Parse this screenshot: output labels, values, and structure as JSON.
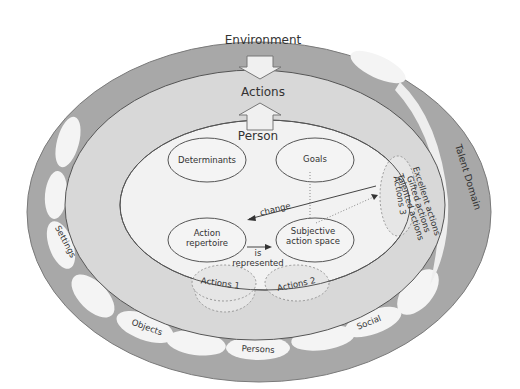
{
  "diagram": {
    "outer_ring": {
      "label": "Environment",
      "color": "#a6a6a6"
    },
    "middle_ring": {
      "label": "Actions",
      "color": "#d6d6d6"
    },
    "inner": {
      "label": "Person",
      "color": "#f0f0f0"
    },
    "components": {
      "determinants": "Determinants",
      "goals": "Goals",
      "action_repertoire_line1": "Action",
      "action_repertoire_line2": "repertoire",
      "subjective_line1": "Subjective",
      "subjective_line2": "action space"
    },
    "arrows": {
      "change": "change",
      "is_represented_line1": "is",
      "is_represented_line2": "represented"
    },
    "actions": {
      "a1": "Actions 1",
      "a2": "Actions 2",
      "a3": "Actions 3"
    },
    "action_levels": [
      "Excellent actions",
      "Gifted actions",
      "Talented actions"
    ],
    "talent_domain": "Talent Domain",
    "environment_beads": {
      "settings": "Settings",
      "objects": "Objects",
      "persons": "Persons",
      "social": "Social"
    }
  }
}
